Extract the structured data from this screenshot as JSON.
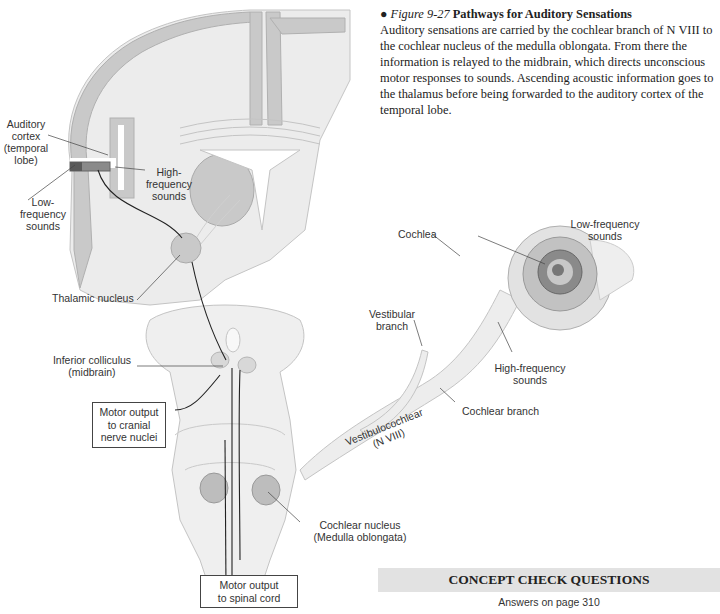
{
  "caption": {
    "bullet": "●",
    "figure_number": "Figure 9-27",
    "title": "Pathways for Auditory Sensations",
    "body": "Auditory sensations are carried by the cochlear branch of N VIII to the cochlear nucleus of the medulla oblongata. From there the information is relayed to the midbrain, which directs unconscious motor responses to sounds. Ascending acoustic information goes to the thalamus before being forwarded to the auditory cortex of the temporal lobe."
  },
  "labels": {
    "auditory_cortex": [
      "Auditory",
      "cortex",
      "(temporal",
      "lobe)"
    ],
    "low_freq_cortex": [
      "Low-",
      "frequency",
      "sounds"
    ],
    "high_freq_cortex": [
      "High-",
      "frequency",
      "sounds"
    ],
    "thalamic_nucleus": "Thalamic nucleus",
    "inferior_colliculus": [
      "Inferior colliculus",
      "(midbrain)"
    ],
    "motor_cranial": [
      "Motor output",
      "to cranial",
      "nerve nuclei"
    ],
    "motor_spinal": [
      "Motor output",
      "to spinal cord"
    ],
    "cochlear_nucleus": [
      "Cochlear nucleus",
      "(Medulla oblongata)"
    ],
    "cochlea": "Cochlea",
    "low_freq_cochlea": [
      "Low-frequency",
      "sounds"
    ],
    "high_freq_cochlea": [
      "High-frequency",
      "sounds"
    ],
    "vestibular_branch": [
      "Vestibular",
      "branch"
    ],
    "cochlear_branch": "Cochlear branch",
    "vestibulocochlear": [
      "Vestibulocochlear",
      "(N VIII)"
    ]
  },
  "concept_check": {
    "title": "CONCEPT CHECK QUESTIONS",
    "subtitle": "Answers on page 310"
  },
  "colors": {
    "cortex_gray": "#c9c9c9",
    "white_matter": "#ececec",
    "cc_bar": "#e2e2e2"
  }
}
